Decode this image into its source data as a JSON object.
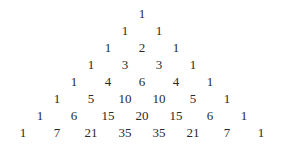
{
  "rows": [
    [
      1
    ],
    [
      1,
      1
    ],
    [
      1,
      2,
      1
    ],
    [
      1,
      3,
      3,
      1
    ],
    [
      1,
      4,
      6,
      4,
      1
    ],
    [
      1,
      5,
      10,
      10,
      5,
      1
    ],
    [
      1,
      6,
      15,
      20,
      15,
      6,
      1
    ],
    [
      1,
      7,
      21,
      35,
      35,
      21,
      7,
      1
    ]
  ],
  "layout": {
    "center_x": 142,
    "first_row_y": 14,
    "row_spacing": 17,
    "col_spacing": 34
  }
}
